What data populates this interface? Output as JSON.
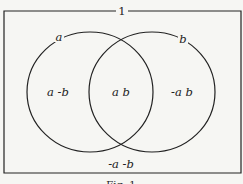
{
  "diagram": {
    "type": "venn",
    "universe_label": "1",
    "sets": [
      {
        "name": "a",
        "label": "a"
      },
      {
        "name": "b",
        "label": "b"
      }
    ],
    "regions": {
      "a_not_b": "a -b",
      "a_and_b": "a b",
      "b_not_a": "-a b",
      "neither": "-a -b"
    },
    "caption": "Fig. 1"
  }
}
